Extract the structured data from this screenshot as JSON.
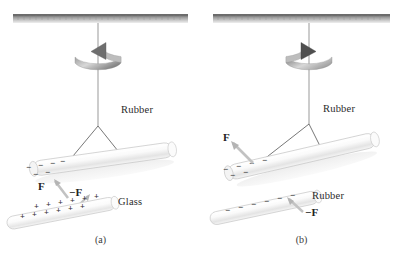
{
  "figure": {
    "background_color": "#ffffff",
    "ceiling_color": "#8f8f8f",
    "rod_color": "#f2f2f2",
    "thread_color": "#555555",
    "charge_color": "#333333"
  },
  "panels": [
    {
      "id": "a",
      "caption": "(a)",
      "rotation": {
        "direction": "counterclockwise",
        "arrow_head": "left",
        "name": "rotation-arrow-left"
      },
      "suspended_rod": {
        "material": "Rubber",
        "label": "Rubber",
        "charge_sign": "-",
        "charge_symbols": [
          "−",
          "−",
          "−",
          "−",
          "−",
          "−"
        ]
      },
      "approaching_rod": {
        "material": "Glass",
        "label": "Glass",
        "charge_sign": "+",
        "charge_symbols": [
          "+",
          "+",
          "+",
          "+",
          "+",
          "+",
          "+",
          "+",
          "+",
          "+"
        ]
      },
      "forces": [
        {
          "label": "F",
          "name": "force-f-upper",
          "target": "rubber-rod"
        },
        {
          "label": "−F",
          "name": "force-minus-f-lower",
          "target": "glass-rod"
        }
      ],
      "interaction": "attraction"
    },
    {
      "id": "b",
      "caption": "(b)",
      "rotation": {
        "direction": "clockwise",
        "arrow_head": "right",
        "name": "rotation-arrow-right"
      },
      "suspended_rod": {
        "material": "Rubber",
        "label": "Rubber",
        "charge_sign": "-",
        "charge_symbols": [
          "−",
          "−",
          "−",
          "−",
          "−",
          "−"
        ]
      },
      "approaching_rod": {
        "material": "Rubber",
        "label": "Rubber",
        "charge_sign": "-",
        "charge_symbols": [
          "−",
          "−",
          "−",
          "−",
          "−",
          "−"
        ]
      },
      "forces": [
        {
          "label": "F",
          "name": "force-f-upper",
          "target": "rubber-rod-suspended"
        },
        {
          "label": "−F",
          "name": "force-minus-f-lower",
          "target": "rubber-rod-handheld"
        }
      ],
      "interaction": "repulsion"
    }
  ],
  "footer": {
    "cut_text": ""
  }
}
